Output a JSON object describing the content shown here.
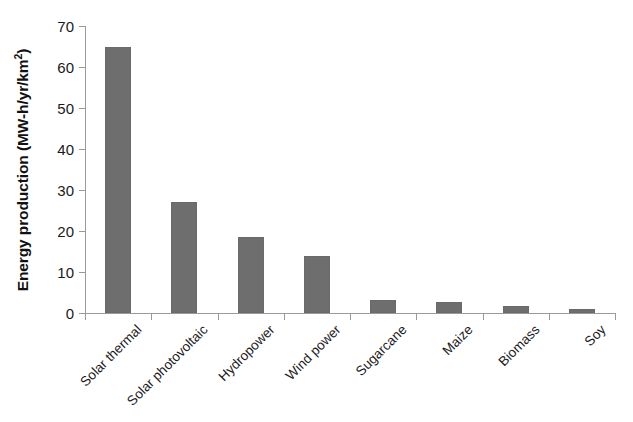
{
  "chart_data": {
    "type": "bar",
    "title": "",
    "subtitle": "",
    "xlabel": "",
    "ylabel": "Energy production (MW-h/yr/km2)",
    "ylabel_parts": {
      "main": "Energy production (MW-h/yr/km",
      "superscript": "2",
      "tail": ")"
    },
    "categories": [
      "Solar thermal",
      "Solar photovoltaic",
      "Hydropower",
      "Wind power",
      "Sugarcane",
      "Maize",
      "Biomass",
      "Soy"
    ],
    "values": [
      65.0,
      27.0,
      18.5,
      13.8,
      3.2,
      2.6,
      1.8,
      0.9
    ],
    "ylim": [
      0,
      70
    ],
    "ytick_values": [
      0,
      10,
      20,
      30,
      40,
      50,
      60,
      70
    ],
    "ytick_labels": [
      "0",
      "10",
      "20",
      "30",
      "40",
      "50",
      "60",
      "70"
    ],
    "grid": false,
    "legend": null,
    "legend_position": "none",
    "bar_color": "#6e6e6e",
    "axis_color": "#9a9a9a",
    "background_color": "#ffffff",
    "xlabel_rotation_degrees": -45
  }
}
